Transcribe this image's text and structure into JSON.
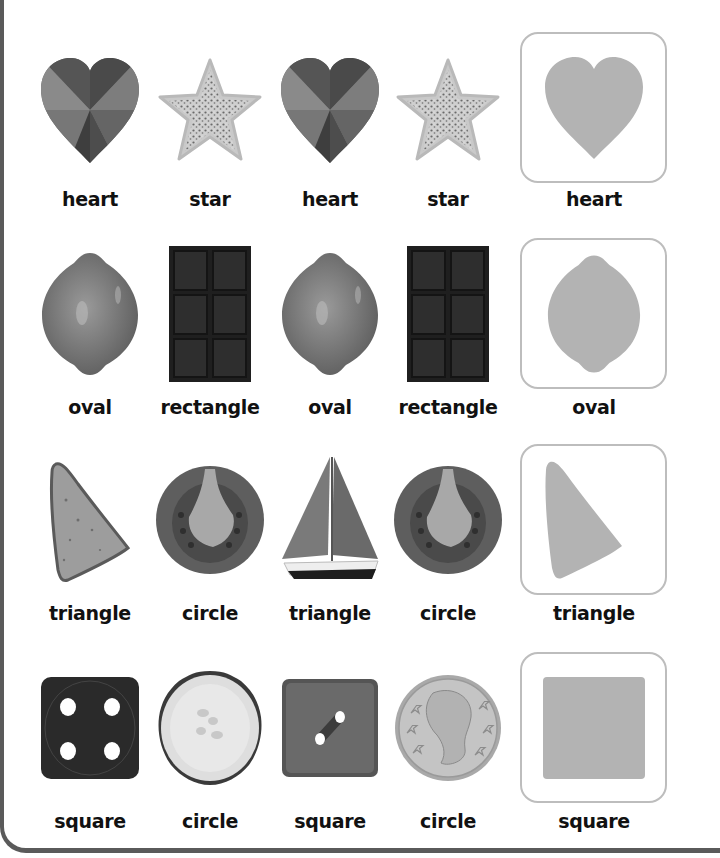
{
  "worksheet": {
    "colors": {
      "border": "#5a5a5a",
      "answer_box_border": "#bdbdbd",
      "silhouette": "#b3b3b3",
      "label": "#111111"
    },
    "rows": [
      {
        "items": [
          {
            "object": "faceted gem heart",
            "label": "heart"
          },
          {
            "object": "glitter star",
            "label": "star"
          },
          {
            "object": "faceted gem heart",
            "label": "heart"
          },
          {
            "object": "glitter star",
            "label": "star"
          }
        ],
        "answer": {
          "shape": "heart",
          "label": "heart"
        }
      },
      {
        "items": [
          {
            "object": "lemon",
            "label": "oval"
          },
          {
            "object": "chocolate bar",
            "label": "rectangle"
          },
          {
            "object": "lemon",
            "label": "oval"
          },
          {
            "object": "chocolate bar",
            "label": "rectangle"
          }
        ],
        "answer": {
          "shape": "oval",
          "label": "oval"
        }
      },
      {
        "items": [
          {
            "object": "toast slice",
            "label": "triangle"
          },
          {
            "object": "tomato slice",
            "label": "circle"
          },
          {
            "object": "sailboat",
            "label": "triangle"
          },
          {
            "object": "tomato slice",
            "label": "circle"
          }
        ],
        "answer": {
          "shape": "triangle",
          "label": "triangle"
        }
      },
      {
        "items": [
          {
            "object": "die showing four",
            "label": "square"
          },
          {
            "object": "cucumber slice",
            "label": "circle"
          },
          {
            "object": "square button",
            "label": "square"
          },
          {
            "object": "coin",
            "label": "circle"
          }
        ],
        "answer": {
          "shape": "square",
          "label": "square"
        }
      }
    ]
  }
}
